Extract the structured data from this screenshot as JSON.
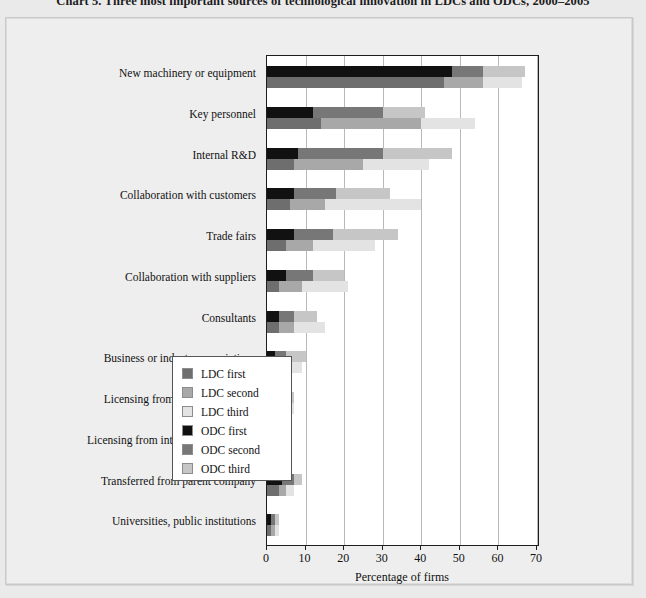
{
  "title": "Chart 5. Three most important sources of technological innovation in LDCs and ODCs, 2000–2005",
  "axis": {
    "x_title": "Percentage of firms",
    "x_ticks": [
      "0",
      "10",
      "20",
      "30",
      "40",
      "50",
      "60",
      "70"
    ]
  },
  "legend": {
    "items": [
      {
        "label": "LDC first",
        "color": "#6e6e6e"
      },
      {
        "label": "LDC second",
        "color": "#a8a8a8"
      },
      {
        "label": "LDC third",
        "color": "#e3e3e3"
      },
      {
        "label": "ODC first",
        "color": "#111111"
      },
      {
        "label": "ODC second",
        "color": "#777777"
      },
      {
        "label": "ODC third",
        "color": "#c6c6c6"
      }
    ]
  },
  "chart_data": {
    "type": "bar",
    "orientation": "horizontal",
    "stacked": true,
    "grouped": true,
    "title": "Chart 5. Three most important sources of technological innovation in LDCs and ODCs, 2000–2005",
    "xlabel": "Percentage of firms",
    "ylabel": "",
    "xlim": [
      0,
      70
    ],
    "xticks": [
      0,
      10,
      20,
      30,
      40,
      50,
      60,
      70
    ],
    "grid": "vertical",
    "legend_position": "inside-lower-right",
    "categories": [
      "New machinery or equipment",
      "Key personnel",
      "Internal R&D",
      "Collaboration with customers",
      "Trade fairs",
      "Collaboration with suppliers",
      "Consultants",
      "Business or industry associations",
      "Licensing from domestic sources",
      "Licensing from international sources",
      "Transferred from parent company",
      "Universities, public institutions"
    ],
    "series": [
      {
        "name": "ODC first",
        "group": "ODC",
        "rank": "first",
        "color": "#111111",
        "values": [
          48,
          12,
          8,
          7,
          7,
          5,
          3,
          2,
          3,
          2,
          4,
          1
        ]
      },
      {
        "name": "ODC second",
        "group": "ODC",
        "rank": "second",
        "color": "#777777",
        "values": [
          8,
          18,
          22,
          11,
          10,
          7,
          4,
          3,
          2,
          2,
          3,
          1
        ]
      },
      {
        "name": "ODC third",
        "group": "ODC",
        "rank": "third",
        "color": "#c6c6c6",
        "values": [
          11,
          11,
          18,
          14,
          17,
          8,
          6,
          5,
          2,
          2,
          2,
          1
        ]
      },
      {
        "name": "LDC first",
        "group": "LDC",
        "rank": "first",
        "color": "#6e6e6e",
        "values": [
          46,
          14,
          7,
          6,
          5,
          3,
          3,
          2,
          2,
          2,
          3,
          1
        ]
      },
      {
        "name": "LDC second",
        "group": "LDC",
        "rank": "second",
        "color": "#a8a8a8",
        "values": [
          10,
          26,
          18,
          9,
          7,
          6,
          4,
          3,
          2,
          2,
          2,
          1
        ]
      },
      {
        "name": "LDC third",
        "group": "LDC",
        "rank": "third",
        "color": "#e3e3e3",
        "values": [
          10,
          14,
          17,
          25,
          16,
          12,
          8,
          4,
          3,
          2,
          2,
          1
        ]
      }
    ],
    "totals": {
      "ODC": [
        67,
        41,
        48,
        32,
        34,
        20,
        13,
        10,
        7,
        6,
        9,
        3
      ],
      "LDC": [
        66,
        54,
        42,
        40,
        28,
        21,
        15,
        9,
        7,
        6,
        7,
        3
      ]
    }
  }
}
